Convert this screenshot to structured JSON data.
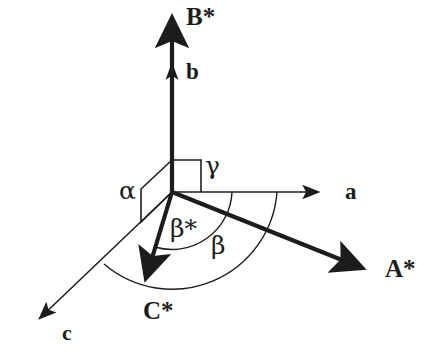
{
  "figure": {
    "background_color": "#ffffff",
    "ink_color": "#1c1c1c",
    "width": 442,
    "height": 363
  },
  "origin": {
    "x": 172,
    "y": 192
  },
  "axes": [
    {
      "key": "B_star",
      "label": "B*",
      "kind": "reciprocal",
      "weight": "thick",
      "direction_deg": 90,
      "tip": {
        "x": 172,
        "y": 12
      },
      "label_pos": {
        "x": 186,
        "y": 6
      }
    },
    {
      "key": "b",
      "label": "b",
      "kind": "direct",
      "weight": "thick",
      "direction_deg": 90,
      "tip": {
        "x": 172,
        "y": 68
      },
      "label_pos": {
        "x": 186,
        "y": 62
      }
    },
    {
      "key": "a",
      "label": "a",
      "kind": "direct",
      "weight": "thin",
      "direction_deg": 0,
      "tip": {
        "x": 330,
        "y": 192
      },
      "label_pos": {
        "x": 345,
        "y": 182
      }
    },
    {
      "key": "A_star",
      "label": "A*",
      "kind": "reciprocal",
      "weight": "thick",
      "direction_deg": -21,
      "tip": {
        "x": 372,
        "y": 272
      },
      "label_pos": {
        "x": 386,
        "y": 258
      }
    },
    {
      "key": "C_star",
      "label": "C*",
      "kind": "reciprocal",
      "weight": "thick",
      "direction_deg": -106,
      "tip": {
        "x": 143,
        "y": 288
      },
      "label_pos": {
        "x": 145,
        "y": 300
      }
    },
    {
      "key": "c",
      "label": "c",
      "kind": "direct",
      "weight": "thin",
      "direction_deg": -139,
      "tip": {
        "x": 28,
        "y": 328
      },
      "label_pos": {
        "x": 62,
        "y": 324
      }
    }
  ],
  "angles": [
    {
      "key": "gamma",
      "label": "γ",
      "marker": "right-angle-square",
      "between": [
        "b",
        "a"
      ],
      "label_pos": {
        "x": 206,
        "y": 156
      }
    },
    {
      "key": "alpha",
      "label": "α",
      "marker": "parallelogram",
      "between": [
        "b",
        "c"
      ],
      "label_pos": {
        "x": 121,
        "y": 180
      }
    },
    {
      "key": "beta_star",
      "label": "β*",
      "marker": "arc-small",
      "between": [
        "a",
        "C*"
      ],
      "label_pos": {
        "x": 172,
        "y": 219
      }
    },
    {
      "key": "beta",
      "label": "β",
      "marker": "arc-large",
      "between": [
        "a",
        "c"
      ],
      "label_pos": {
        "x": 212,
        "y": 235
      }
    }
  ]
}
